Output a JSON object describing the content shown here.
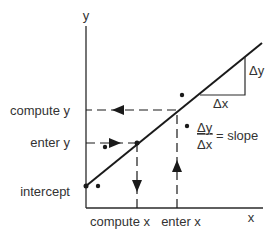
{
  "diagram": {
    "axes": {
      "y_label": "y",
      "x_label": "x"
    },
    "y_labels": {
      "compute_y": "compute y",
      "enter_y": "enter y",
      "intercept": "intercept"
    },
    "x_labels": {
      "compute_x": "compute x",
      "enter_x": "enter x"
    },
    "triangle": {
      "delta_y": "Δy",
      "delta_x": "Δx"
    },
    "slope_formula": {
      "numerator": "Δy",
      "denominator": "Δx",
      "equals": "= slope"
    },
    "colors": {
      "ink": "#1a1a1a",
      "text": "#333333",
      "background": "#ffffff"
    }
  }
}
